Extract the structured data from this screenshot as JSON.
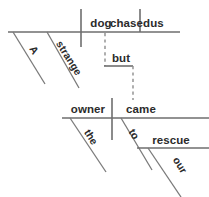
{
  "diagram": {
    "type": "reed-kellogg-sentence-diagram",
    "sentence": "A strange dog chased us but the owner came to our rescue",
    "canvas": {
      "width": 209,
      "height": 197,
      "background": "#ffffff"
    },
    "colors": {
      "line": "#6e6e6e",
      "dashed_line": "#8d8d8d",
      "text": "#2b2b2b",
      "background": "#ffffff"
    },
    "clauses": [
      {
        "id": "clause-1",
        "role": "independent-clause-1",
        "baseline": {
          "x1": 8,
          "y": 32,
          "x2": 180
        },
        "words": [
          {
            "id": "subject-1",
            "text": "dog",
            "role": "subject",
            "x": 101,
            "y": 27,
            "anchor": "middle",
            "orientation": "horizontal"
          },
          {
            "id": "verb-1",
            "text": "chased",
            "role": "verb",
            "x": 110,
            "y": 27,
            "anchor": "start",
            "orientation": "horizontal"
          },
          {
            "id": "object-1",
            "text": "us",
            "role": "direct-object",
            "x": 157,
            "y": 27,
            "anchor": "middle",
            "orientation": "horizontal"
          },
          {
            "id": "modifier-a",
            "text": "A",
            "role": "article-modifier",
            "modifies": "dog",
            "x": 31,
            "y": 52,
            "anchor": "middle",
            "orientation": "diagonal",
            "rotate": 58
          },
          {
            "id": "modifier-strange",
            "text": "strange",
            "role": "adjective-modifier",
            "modifies": "dog",
            "x": 66,
            "y": 60,
            "anchor": "middle",
            "orientation": "diagonal",
            "rotate": 58
          }
        ],
        "verticals": [
          {
            "id": "subject-verb-divider",
            "x": 81,
            "y1": 9,
            "y2": 47,
            "style": "solid"
          },
          {
            "id": "verb-object-divider",
            "x": 140,
            "y1": 9,
            "y2": 32,
            "style": "solid"
          }
        ],
        "diagonals": [
          {
            "id": "a-slant",
            "x1": 13,
            "y1": 32,
            "x2": 45,
            "y2": 84
          },
          {
            "id": "strange-slant",
            "x1": 47,
            "y1": 32,
            "x2": 79,
            "y2": 88
          }
        ]
      },
      {
        "id": "clause-2",
        "role": "independent-clause-2",
        "baseline": {
          "x1": 62,
          "y": 118,
          "x2": 209
        },
        "words": [
          {
            "id": "subject-2",
            "text": "owner",
            "role": "subject",
            "x": 88,
            "y": 113,
            "anchor": "middle",
            "orientation": "horizontal"
          },
          {
            "id": "verb-2",
            "text": "came",
            "role": "verb",
            "x": 141,
            "y": 113,
            "anchor": "middle",
            "orientation": "horizontal"
          },
          {
            "id": "modifier-the",
            "text": "the",
            "role": "article-modifier",
            "modifies": "owner",
            "x": 88,
            "y": 139,
            "anchor": "middle",
            "orientation": "diagonal",
            "rotate": 58
          },
          {
            "id": "preposition-to",
            "text": "to",
            "role": "preposition",
            "modifies": "came",
            "x": 131,
            "y": 135,
            "anchor": "middle",
            "orientation": "diagonal",
            "rotate": 58
          },
          {
            "id": "object-of-preposition",
            "text": "rescue",
            "role": "object-of-preposition",
            "x": 171,
            "y": 144,
            "anchor": "middle",
            "orientation": "horizontal"
          },
          {
            "id": "modifier-our",
            "text": "our",
            "role": "possessive-modifier",
            "modifies": "rescue",
            "x": 176,
            "y": 167,
            "anchor": "middle",
            "orientation": "diagonal",
            "rotate": 58
          }
        ],
        "verticals": [
          {
            "id": "subject-verb-divider-2",
            "x": 112,
            "y1": 98,
            "y2": 140,
            "style": "solid"
          }
        ],
        "diagonals": [
          {
            "id": "the-slant",
            "x1": 70,
            "y1": 118,
            "x2": 106,
            "y2": 172
          },
          {
            "id": "to-slant",
            "x1": 121,
            "y1": 118,
            "x2": 152,
            "y2": 170
          },
          {
            "id": "our-slant",
            "x1": 148,
            "y1": 148,
            "x2": 180,
            "y2": 197
          }
        ],
        "prep_baseline": {
          "x1": 137,
          "y": 148,
          "x2": 209
        }
      }
    ],
    "conjunction": {
      "id": "coordinating-conjunction",
      "text": "but",
      "role": "coordinating-conjunction",
      "label_x": 121,
      "label_y": 62,
      "connector": {
        "upper_dashed": {
          "x": 105,
          "y1": 33,
          "y2": 66
        },
        "bridge_solid": {
          "x1": 105,
          "y": 66,
          "x2": 133
        },
        "lower_dashed": {
          "x": 133,
          "y1": 66,
          "y2": 100
        }
      }
    }
  }
}
